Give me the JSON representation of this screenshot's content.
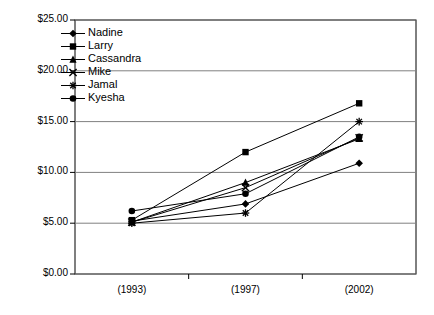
{
  "chart_data": {
    "type": "line",
    "title": "",
    "xlabel": "",
    "ylabel": "",
    "categories": [
      "(1993)",
      "(1997)",
      "(2002)"
    ],
    "ylim": [
      0,
      25
    ],
    "ytick_values": [
      0,
      5,
      10,
      15,
      20,
      25
    ],
    "ytick_labels": [
      "$0.00",
      "$5.00",
      "$10.00",
      "$15.00",
      "$20.00",
      "$25.00"
    ],
    "grid": true,
    "legend_position": "top-left-inside",
    "currency_prefix": "$",
    "series": [
      {
        "name": "Nadine",
        "marker": "diamond",
        "values": [
          5.2,
          6.9,
          10.9
        ]
      },
      {
        "name": "Larry",
        "marker": "square",
        "values": [
          5.3,
          12.0,
          16.8
        ]
      },
      {
        "name": "Cassandra",
        "marker": "triangle",
        "values": [
          5.1,
          9.0,
          13.3
        ]
      },
      {
        "name": "Mike",
        "marker": "x",
        "values": [
          5.1,
          8.5,
          13.4
        ]
      },
      {
        "name": "Jamal",
        "marker": "star",
        "values": [
          5.0,
          6.0,
          15.0
        ]
      },
      {
        "name": "Kyesha",
        "marker": "circle",
        "values": [
          6.2,
          7.9,
          13.5
        ]
      }
    ],
    "colors": {
      "line": "#000000",
      "marker": "#000000",
      "grid": "#808080",
      "axis": "#000000",
      "plot_background": "#ffffff"
    }
  }
}
